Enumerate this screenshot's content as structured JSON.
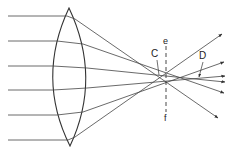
{
  "diagram": {
    "labels": {
      "C": "C",
      "D": "D",
      "e": "e",
      "f": "f"
    },
    "colors": {
      "line": "#333333",
      "background": "#ffffff"
    },
    "incoming_ray_heights": [
      16,
      41,
      66,
      90,
      115,
      140
    ]
  }
}
